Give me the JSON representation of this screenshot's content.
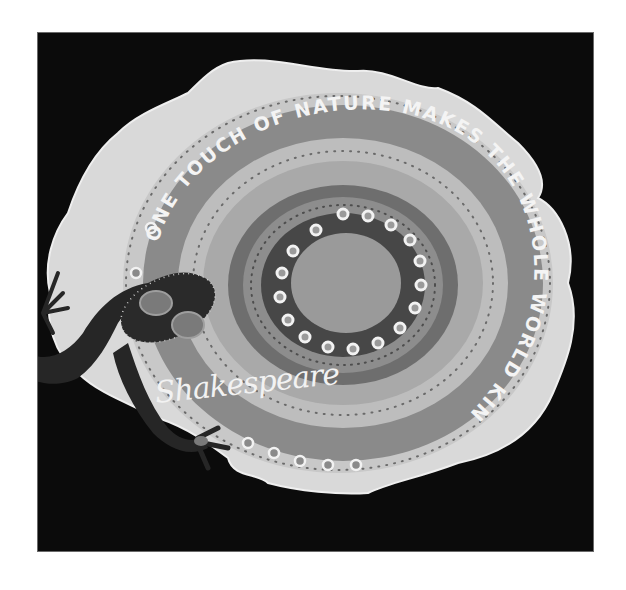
{
  "artwork": {
    "motto": "ONE TOUCH OF NATURE MAKES THE WHOLE WORLD KIN",
    "signature": "Shakespeare",
    "medium": "painted torn paper, photographed in grayscale",
    "colors": {
      "background": "#0b0b0b",
      "paper": "#d9d9d9",
      "text_band": "#8a8a8a",
      "inner_band": "#bdbdbd",
      "dark_ring": "#565656",
      "center_disc": "#9a9a9a",
      "lizard": "#262626",
      "text": "#f4f4f4"
    },
    "elements": {
      "dot_ring_count": 17,
      "lizard": "gecko silhouette with patterned back, left side"
    }
  }
}
